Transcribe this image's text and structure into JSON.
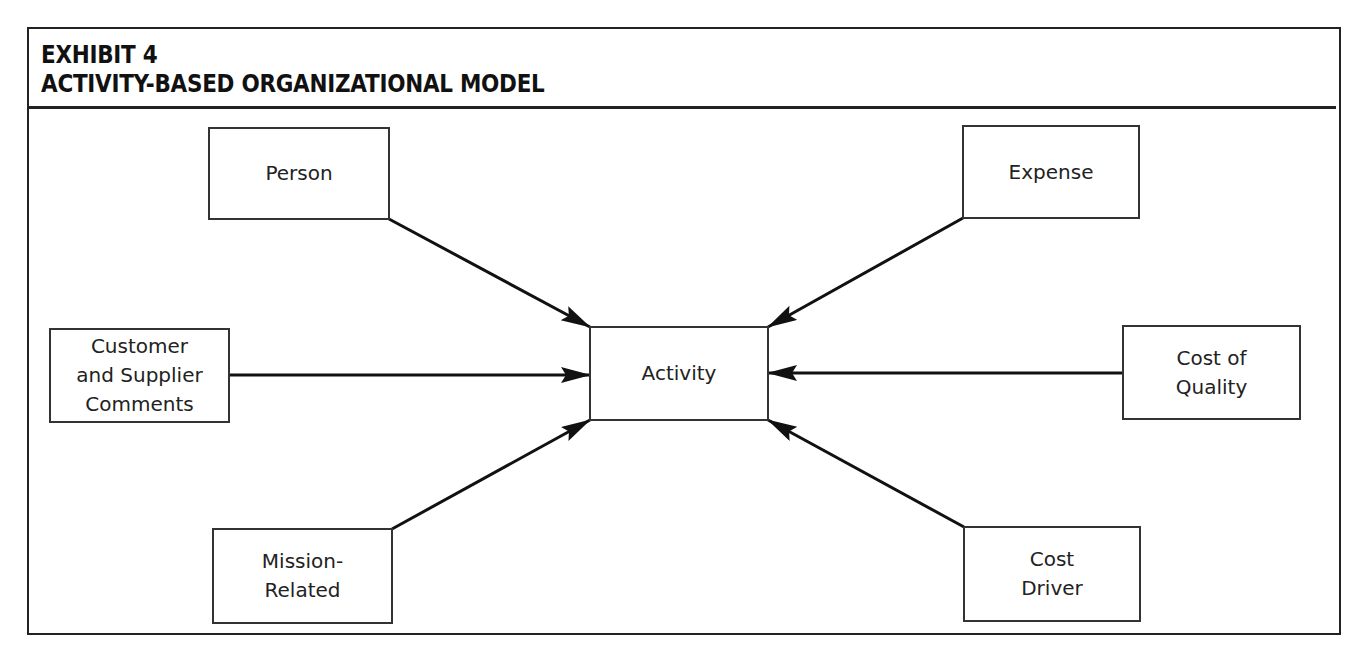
{
  "header": {
    "exhibit_label": "EXHIBIT 4",
    "title": "ACTIVITY-BASED ORGANIZATIONAL MODEL"
  },
  "diagram": {
    "center_node": {
      "id": "activity",
      "label": "Activity"
    },
    "nodes": [
      {
        "id": "person",
        "label": "Person"
      },
      {
        "id": "expense",
        "label": "Expense"
      },
      {
        "id": "customer",
        "label": "Customer\nand Supplier\nComments"
      },
      {
        "id": "cost-of-quality",
        "label": "Cost of\nQuality"
      },
      {
        "id": "mission",
        "label": "Mission-\nRelated"
      },
      {
        "id": "cost-driver",
        "label": "Cost\nDriver"
      }
    ],
    "edges": [
      {
        "from": "person",
        "to": "activity"
      },
      {
        "from": "expense",
        "to": "activity"
      },
      {
        "from": "customer",
        "to": "activity"
      },
      {
        "from": "cost-of-quality",
        "to": "activity"
      },
      {
        "from": "mission",
        "to": "activity"
      },
      {
        "from": "cost-driver",
        "to": "activity"
      }
    ]
  }
}
